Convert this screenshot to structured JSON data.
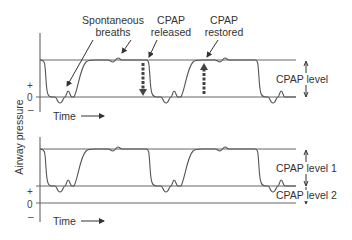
{
  "diagram": {
    "type": "cpap_airway_pressure_waveform",
    "y_axis_label": "Airway pressure",
    "top_panel": {
      "annotations": {
        "spontaneous_line1": "Spontaneous",
        "spontaneous_line2": "breaths",
        "released_line1": "CPAP",
        "released_line2": "released",
        "restored_line1": "CPAP",
        "restored_line2": "restored"
      },
      "level_label": "CPAP level",
      "tick_plus": "+",
      "tick_zero": "0",
      "tick_minus": "–",
      "time_label": "Time"
    },
    "bottom_panel": {
      "level1_label": "CPAP level 1",
      "level2_label": "CPAP level 2",
      "tick_plus": "+",
      "tick_zero": "0",
      "tick_minus": "–",
      "time_label": "Time"
    },
    "colors": {
      "line": "#555555",
      "text": "#333333",
      "arrow": "#444444",
      "background": "#ffffff"
    }
  }
}
